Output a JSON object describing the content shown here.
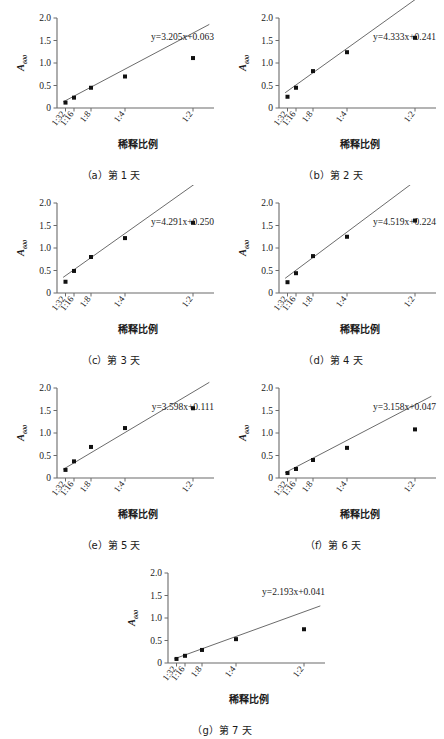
{
  "figure": {
    "axis_label_y_main": "A",
    "axis_label_y_sub": "600",
    "axis_label_x": "稀释比例",
    "y_ticks": [
      "0",
      "0.5",
      "1.0",
      "1.5",
      "2.0"
    ],
    "x_ticks": [
      "1:32",
      "1:16",
      "1:8",
      "1:4",
      "1:2"
    ],
    "line_color": "#5a5a5a",
    "marker_color": "#111111",
    "axis_color": "#6b6b6b"
  },
  "chart_data": [
    {
      "type": "scatter",
      "panel": "a",
      "caption": "（a）第 1 天",
      "equation": "y=3.205x+0.063",
      "slope": 3.205,
      "intercept": 0.063,
      "xlabel": "稀释比例",
      "ylabel": "A600",
      "categories": [
        "1:32",
        "1:16",
        "1:8",
        "1:4",
        "1:2"
      ],
      "x": [
        0.03125,
        0.0625,
        0.125,
        0.25,
        0.5
      ],
      "values": [
        0.12,
        0.23,
        0.45,
        0.7,
        1.11
      ],
      "ylim": [
        0,
        2.0
      ],
      "grid": false,
      "legend": "none"
    },
    {
      "type": "scatter",
      "panel": "b",
      "caption": "（b）第 2 天",
      "equation": "y=4.333x+0.241",
      "slope": 4.333,
      "intercept": 0.241,
      "xlabel": "稀释比例",
      "ylabel": "A600",
      "categories": [
        "1:32",
        "1:16",
        "1:8",
        "1:4",
        "1:2"
      ],
      "x": [
        0.03125,
        0.0625,
        0.125,
        0.25,
        0.5
      ],
      "values": [
        0.25,
        0.45,
        0.82,
        1.24,
        1.56
      ],
      "ylim": [
        0,
        2.0
      ],
      "grid": false,
      "legend": "none"
    },
    {
      "type": "scatter",
      "panel": "c",
      "caption": "（c）第 3 天",
      "equation": "y=4.291x+0.250",
      "slope": 4.291,
      "intercept": 0.25,
      "xlabel": "稀释比例",
      "ylabel": "A600",
      "categories": [
        "1:32",
        "1:16",
        "1:8",
        "1:4",
        "1:2"
      ],
      "x": [
        0.03125,
        0.0625,
        0.125,
        0.25,
        0.5
      ],
      "values": [
        0.25,
        0.49,
        0.8,
        1.22,
        1.56
      ],
      "ylim": [
        0,
        2.0
      ],
      "grid": false,
      "legend": "none"
    },
    {
      "type": "scatter",
      "panel": "d",
      "caption": "（d）第 4 天",
      "equation": "y=4.519x+0.224",
      "slope": 4.519,
      "intercept": 0.224,
      "xlabel": "稀释比例",
      "ylabel": "A600",
      "categories": [
        "1:32",
        "1:16",
        "1:8",
        "1:4",
        "1:2"
      ],
      "x": [
        0.03125,
        0.0625,
        0.125,
        0.25,
        0.5
      ],
      "values": [
        0.24,
        0.44,
        0.82,
        1.25,
        1.61
      ],
      "ylim": [
        0,
        2.0
      ],
      "grid": false,
      "legend": "none"
    },
    {
      "type": "scatter",
      "panel": "e",
      "caption": "（e）第 5 天",
      "equation": "y=3.598x+0.111",
      "slope": 3.598,
      "intercept": 0.111,
      "xlabel": "稀释比例",
      "ylabel": "A600",
      "categories": [
        "1:32",
        "1:16",
        "1:8",
        "1:4",
        "1:2"
      ],
      "x": [
        0.03125,
        0.0625,
        0.125,
        0.25,
        0.5
      ],
      "values": [
        0.18,
        0.37,
        0.69,
        1.11,
        1.55
      ],
      "ylim": [
        0,
        2.0
      ],
      "grid": false,
      "legend": "none"
    },
    {
      "type": "scatter",
      "panel": "f",
      "caption": "（f）第 6 天",
      "equation": "y=3.158x+0.047",
      "slope": 3.158,
      "intercept": 0.047,
      "xlabel": "稀释比例",
      "ylabel": "A600",
      "categories": [
        "1:32",
        "1:16",
        "1:8",
        "1:4",
        "1:2"
      ],
      "x": [
        0.03125,
        0.0625,
        0.125,
        0.25,
        0.5
      ],
      "values": [
        0.11,
        0.2,
        0.4,
        0.67,
        1.08
      ],
      "ylim": [
        0,
        2.0
      ],
      "grid": false,
      "legend": "none"
    },
    {
      "type": "scatter",
      "panel": "g",
      "caption": "（g）第 7 天",
      "equation": "y=2.193x+0.041",
      "slope": 2.193,
      "intercept": 0.041,
      "xlabel": "稀释比例",
      "ylabel": "A600",
      "categories": [
        "1:32",
        "1:16",
        "1:8",
        "1:4",
        "1:2"
      ],
      "x": [
        0.03125,
        0.0625,
        0.125,
        0.25,
        0.5
      ],
      "values": [
        0.09,
        0.16,
        0.29,
        0.53,
        0.75
      ],
      "ylim": [
        0,
        2.0
      ],
      "grid": false,
      "legend": "none"
    }
  ]
}
